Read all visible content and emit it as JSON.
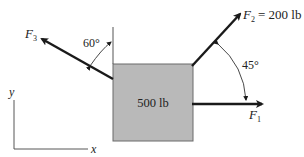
{
  "diagram": {
    "block": {
      "label": "500 lb",
      "fill": "#b9b9b9",
      "border": "#6a6a6a"
    },
    "forces": [
      {
        "name": "F",
        "sub": "1",
        "value": "",
        "direction": "right (+x)"
      },
      {
        "name": "F",
        "sub": "2",
        "value": "= 200 lb",
        "angle_label": "45°",
        "angle_ref": "from +x axis"
      },
      {
        "name": "F",
        "sub": "3",
        "value": "",
        "angle_label": "60°",
        "angle_ref": "from vertical"
      }
    ],
    "axes": {
      "x_label": "x",
      "y_label": "y"
    },
    "colors": {
      "arrow": "#1a1a1a",
      "text": "#222222"
    }
  }
}
